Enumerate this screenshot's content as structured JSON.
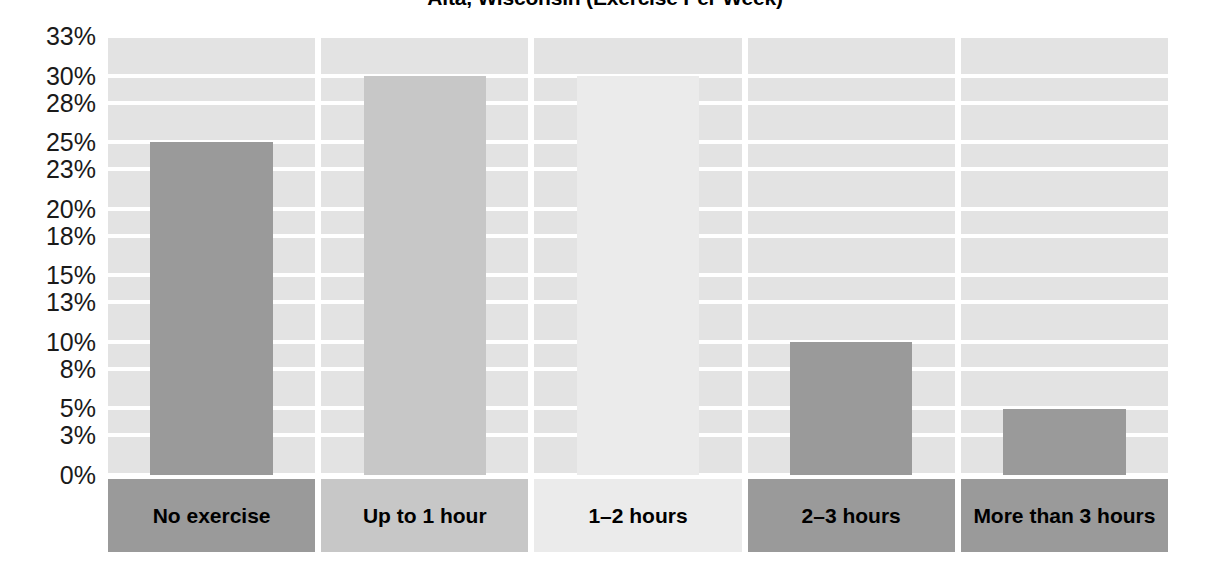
{
  "chart_data": {
    "type": "bar",
    "title": "Alta, Wisconsin (Exercise Per Week)",
    "xlabel": "",
    "ylabel": "",
    "categories": [
      "No exercise",
      "Up to 1 hour",
      "1–2 hours",
      "2–3 hours",
      "More than 3 hours"
    ],
    "values": [
      25,
      30,
      30,
      10,
      5
    ],
    "value_labels": [
      "25%",
      "30%",
      "30%",
      "10%",
      "5%"
    ],
    "ylim": [
      0,
      33
    ],
    "ytick_values": [
      0,
      3,
      5,
      8,
      10,
      13,
      15,
      18,
      20,
      23,
      25,
      28,
      30,
      33
    ],
    "ytick_labels": [
      "0%",
      "3%",
      "5%",
      "8%",
      "10%",
      "13%",
      "15%",
      "18%",
      "20%",
      "23%",
      "25%",
      "28%",
      "30%",
      "33%"
    ],
    "grid": true,
    "legend": false,
    "bar_colors": [
      "#9a9a9a",
      "#c7c7c7",
      "#ebebeb",
      "#9a9a9a",
      "#9a9a9a"
    ],
    "plot_band_color": "#e3e3e3",
    "gridline_color": "#ffffff"
  }
}
